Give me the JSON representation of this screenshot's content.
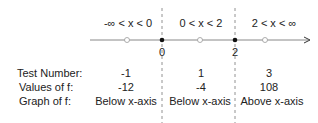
{
  "intervals": [
    {
      "label": "-∞ < x < 0"
    },
    {
      "label": "0 < x < 2"
    },
    {
      "label": "2 < x < ∞"
    }
  ],
  "critical_points": [
    {
      "label": "0"
    },
    {
      "label": "2"
    }
  ],
  "rows": {
    "test_number": {
      "label": "Test Number:",
      "values": [
        "-1",
        "1",
        "3"
      ]
    },
    "values_of_f": {
      "label": "Values of f:",
      "values": [
        "-12",
        "-4",
        "108"
      ]
    },
    "graph_of_f": {
      "label": "Graph of f:",
      "values": [
        "Below x-axis",
        "Below x-axis",
        "Above x-axis"
      ]
    }
  }
}
